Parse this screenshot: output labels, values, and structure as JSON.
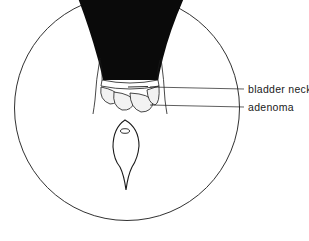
{
  "figure": {
    "type": "endoscopic view illustration",
    "colors": {
      "ink": "#1a1a1a",
      "background": "#ffffff",
      "adenoma_fill": "#f2f2f2"
    }
  },
  "labels": [
    {
      "id": "bladder-neck",
      "text": "bladder neck"
    },
    {
      "id": "adenoma",
      "text": "adenoma"
    }
  ]
}
